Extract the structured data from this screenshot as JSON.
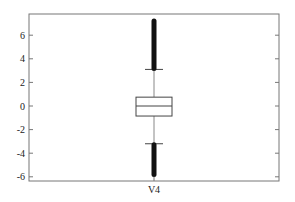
{
  "chart_data": {
    "type": "box",
    "title": "",
    "xlabel": "",
    "ylabel": "",
    "categories": [
      "V4"
    ],
    "ylim": [
      -6.3,
      7.8
    ],
    "yticks": [
      -6,
      -4,
      -2,
      0,
      2,
      4,
      6
    ],
    "ytick_labels": [
      "-6",
      "-4",
      "-2",
      "0",
      "2",
      "4",
      "6"
    ],
    "grid": false,
    "boxes": [
      {
        "label": "V4",
        "q1": -0.85,
        "median": 0.0,
        "q3": 0.75,
        "whisker_low": -3.2,
        "whisker_high": 3.1,
        "outliers_high_range": [
          3.1,
          7.2
        ],
        "outliers_low_range": [
          -5.8,
          -3.2
        ]
      }
    ]
  }
}
